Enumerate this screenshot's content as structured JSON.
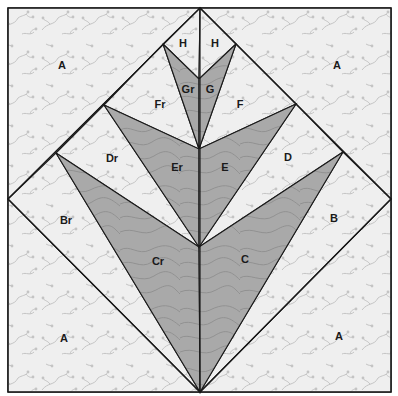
{
  "diagram": {
    "type": "quilt-block-pattern",
    "colors": {
      "light_fabric": "#efefef",
      "light_print": "#c4c4c4",
      "dark_fabric": "#a9a9a9",
      "dark_print": "#8a8a8a",
      "line": "#1a1a1a"
    },
    "pieces": [
      {
        "id": "A-tl",
        "label": "A",
        "fabric": "light",
        "label_pos": [
          62,
          66
        ]
      },
      {
        "id": "A-tr",
        "label": "A",
        "fabric": "light",
        "label_pos": [
          337,
          66
        ]
      },
      {
        "id": "A-bl",
        "label": "A",
        "fabric": "light",
        "label_pos": [
          64,
          339
        ]
      },
      {
        "id": "A-br",
        "label": "A",
        "fabric": "light",
        "label_pos": [
          339,
          337
        ]
      },
      {
        "id": "Br",
        "label": "Br",
        "fabric": "light",
        "label_pos": [
          66,
          221
        ]
      },
      {
        "id": "B",
        "label": "B",
        "fabric": "light",
        "label_pos": [
          334,
          219
        ]
      },
      {
        "id": "Cr",
        "label": "Cr",
        "fabric": "dark",
        "label_pos": [
          158,
          262
        ]
      },
      {
        "id": "C",
        "label": "C",
        "fabric": "dark",
        "label_pos": [
          245,
          260
        ]
      },
      {
        "id": "Dr",
        "label": "Dr",
        "fabric": "light",
        "label_pos": [
          112,
          159
        ]
      },
      {
        "id": "D",
        "label": "D",
        "fabric": "light",
        "label_pos": [
          288,
          158
        ]
      },
      {
        "id": "Er",
        "label": "Er",
        "fabric": "dark",
        "label_pos": [
          177,
          168
        ]
      },
      {
        "id": "E",
        "label": "E",
        "fabric": "dark",
        "label_pos": [
          225,
          168
        ]
      },
      {
        "id": "Fr",
        "label": "Fr",
        "fabric": "light",
        "label_pos": [
          160,
          105
        ]
      },
      {
        "id": "F",
        "label": "F",
        "fabric": "light",
        "label_pos": [
          240,
          105
        ]
      },
      {
        "id": "Gr",
        "label": "Gr",
        "fabric": "dark",
        "label_pos": [
          188,
          90
        ]
      },
      {
        "id": "G",
        "label": "G",
        "fabric": "dark",
        "label_pos": [
          210,
          90
        ]
      },
      {
        "id": "Hl",
        "label": "H",
        "fabric": "light",
        "label_pos": [
          183,
          44
        ]
      },
      {
        "id": "Hr",
        "label": "H",
        "fabric": "light",
        "label_pos": [
          215,
          44
        ]
      }
    ]
  }
}
